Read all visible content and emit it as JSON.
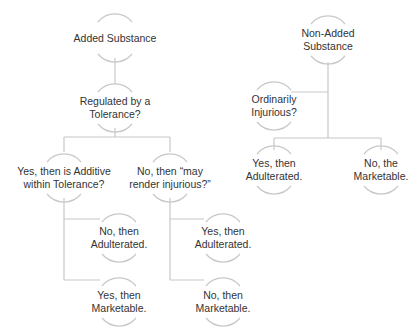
{
  "diagram": {
    "type": "decision-tree",
    "colors": {
      "line": "#c8c8c8",
      "text": "#333333",
      "background": "#ffffff"
    },
    "nodes": [
      {
        "id": "added",
        "lines": [
          "Added Substance"
        ],
        "x": 115,
        "y": 38
      },
      {
        "id": "regulated",
        "lines": [
          "Regulated by a",
          "Tolerance?"
        ],
        "x": 115,
        "y": 108
      },
      {
        "id": "yes_additive",
        "lines": [
          "Yes, then is Additive",
          "within Tolerance?"
        ],
        "x": 64,
        "y": 178
      },
      {
        "id": "no_render",
        "lines": [
          "No, then “may",
          "render injurious?”"
        ],
        "x": 170,
        "y": 178
      },
      {
        "id": "no_adult",
        "lines": [
          "No, then",
          "Adulterated."
        ],
        "x": 119,
        "y": 238
      },
      {
        "id": "yes_market",
        "lines": [
          "Yes, then",
          "Marketable."
        ],
        "x": 119,
        "y": 302
      },
      {
        "id": "yes_adult2",
        "lines": [
          "Yes, then",
          "Adulterated."
        ],
        "x": 223,
        "y": 238
      },
      {
        "id": "no_market2",
        "lines": [
          "No, then",
          "Marketable."
        ],
        "x": 223,
        "y": 302
      },
      {
        "id": "nonadded",
        "lines": [
          "Non-Added",
          "Substance"
        ],
        "x": 328,
        "y": 40
      },
      {
        "id": "ordinarily",
        "lines": [
          "Ordinarily",
          "Injurious?"
        ],
        "x": 274,
        "y": 106
      },
      {
        "id": "yes_adult3",
        "lines": [
          "Yes, then",
          "Adulterated."
        ],
        "x": 274,
        "y": 170
      },
      {
        "id": "no_market3",
        "lines": [
          "No, the",
          "Marketable."
        ],
        "x": 381,
        "y": 170
      }
    ]
  }
}
